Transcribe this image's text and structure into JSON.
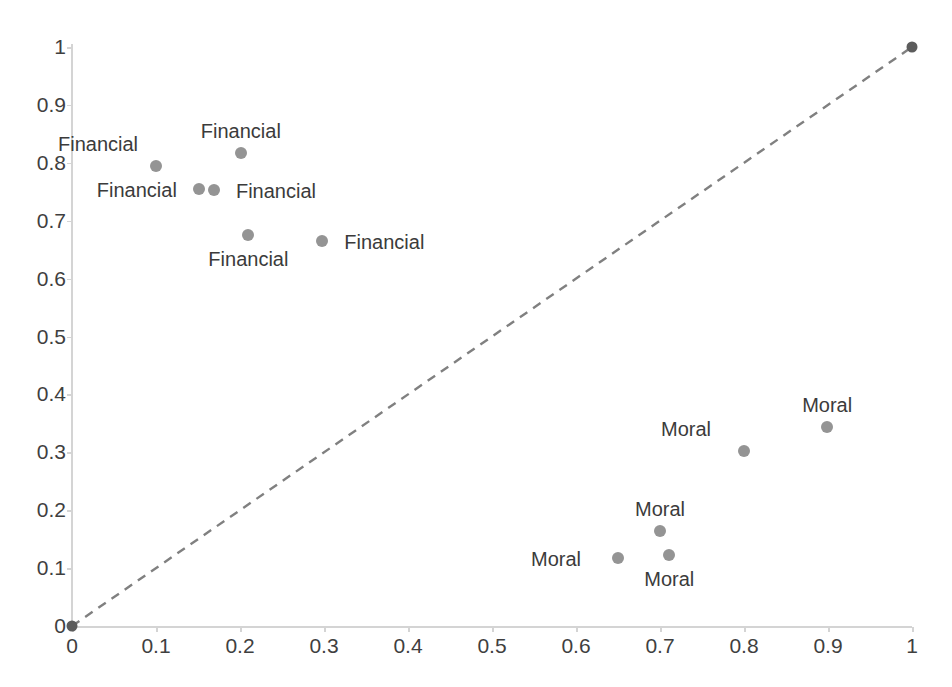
{
  "chart_data": {
    "type": "scatter",
    "title": "",
    "xlabel": "",
    "ylabel": "",
    "xlim": [
      0,
      1
    ],
    "ylim": [
      0,
      1
    ],
    "grid": false,
    "legend": "none",
    "x_ticks": [
      "0",
      "0.1",
      "0.2",
      "0.3",
      "0.4",
      "0.5",
      "0.6",
      "0.7",
      "0.8",
      "0.9",
      "1"
    ],
    "x_tick_values": [
      0,
      0.1,
      0.2,
      0.3,
      0.4,
      0.5,
      0.6,
      0.7,
      0.8,
      0.9,
      1
    ],
    "y_ticks": [
      "0",
      "0.1",
      "0.2",
      "0.3",
      "0.4",
      "0.5",
      "0.6",
      "0.7",
      "0.8",
      "0.9",
      "1"
    ],
    "y_tick_values": [
      0,
      0.1,
      0.2,
      0.3,
      0.4,
      0.5,
      0.6,
      0.7,
      0.8,
      0.9,
      1
    ],
    "reference_line": {
      "name": "diagonal-identity-line",
      "style": "dashed",
      "color": "#808080",
      "from": [
        0,
        0
      ],
      "to": [
        1,
        1
      ],
      "endpoints_marked": true
    },
    "marker_color": "#949494",
    "label_color": "#3b3b3b",
    "points": [
      {
        "label": "Financial",
        "x": 0.1,
        "y": 0.795,
        "label_pos": "above-left"
      },
      {
        "label": "Financial",
        "x": 0.201,
        "y": 0.817,
        "label_pos": "above"
      },
      {
        "label": "Financial",
        "x": 0.151,
        "y": 0.755,
        "label_pos": "left"
      },
      {
        "label": "Financial",
        "x": 0.169,
        "y": 0.753,
        "label_pos": "right"
      },
      {
        "label": "Financial",
        "x": 0.21,
        "y": 0.675,
        "label_pos": "below"
      },
      {
        "label": "Financial",
        "x": 0.298,
        "y": 0.665,
        "label_pos": "right"
      },
      {
        "label": "Moral",
        "x": 0.8,
        "y": 0.303,
        "label_pos": "above-left"
      },
      {
        "label": "Moral",
        "x": 0.899,
        "y": 0.344,
        "label_pos": "above"
      },
      {
        "label": "Moral",
        "x": 0.7,
        "y": 0.164,
        "label_pos": "above"
      },
      {
        "label": "Moral",
        "x": 0.711,
        "y": 0.123,
        "label_pos": "below"
      },
      {
        "label": "Moral",
        "x": 0.65,
        "y": 0.117,
        "label_pos": "left"
      }
    ],
    "series": [
      {
        "name": "Financial",
        "x": [
          0.1,
          0.201,
          0.151,
          0.169,
          0.21,
          0.298
        ],
        "y": [
          0.795,
          0.817,
          0.755,
          0.753,
          0.675,
          0.665
        ]
      },
      {
        "name": "Moral",
        "x": [
          0.8,
          0.899,
          0.7,
          0.711,
          0.65
        ],
        "y": [
          0.303,
          0.344,
          0.164,
          0.123,
          0.117
        ]
      }
    ]
  }
}
